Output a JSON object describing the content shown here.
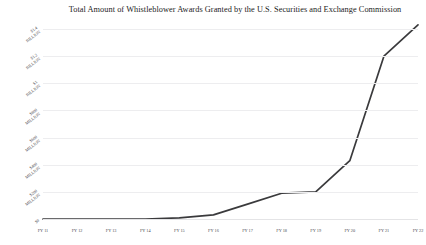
{
  "chart_data": {
    "type": "line",
    "title": "Total Amount of Whistleblower Awards Granted by the U.S. Securities and Exchange Commission",
    "xlabel": "",
    "ylabel": "",
    "categories": [
      "FY 11",
      "FY 12",
      "FY 13",
      "FY 14",
      "FY 15",
      "FY 16",
      "FY 17",
      "FY 18",
      "FY 19",
      "FY 20",
      "FY 21",
      "FY 22"
    ],
    "values": [
      0,
      0,
      0,
      0,
      8,
      30,
      110,
      190,
      200,
      430,
      1200,
      1430
    ],
    "value_unit": "USD millions",
    "ylim": [
      0,
      1400
    ],
    "ytick_values": [
      0,
      200,
      400,
      600,
      800,
      1000,
      1200,
      1400
    ],
    "ytick_labels": [
      {
        "line1": "$0",
        "line2": ""
      },
      {
        "line1": "$200",
        "line2": "MILLION"
      },
      {
        "line1": "$400",
        "line2": "MILLION"
      },
      {
        "line1": "$600",
        "line2": "MILLION"
      },
      {
        "line1": "$800",
        "line2": "MILLION"
      },
      {
        "line1": "$1",
        "line2": "BILLION"
      },
      {
        "line1": "$1.2",
        "line2": "BILLION"
      },
      {
        "line1": "$1.4",
        "line2": "BILLION"
      }
    ],
    "grid": true,
    "legend": false,
    "line_color": "#3a3a3c",
    "background_color": "#ffffff",
    "gridline_color": "#ededef"
  }
}
